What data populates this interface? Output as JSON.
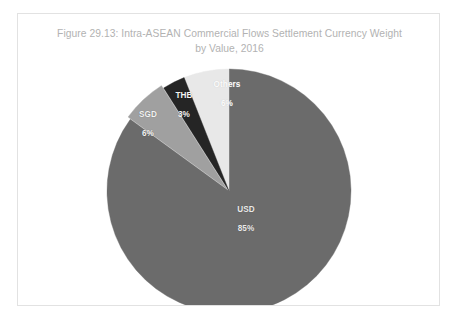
{
  "figure": {
    "title": "Figure 29.13: Intra-ASEAN Commercial Flows Settlement Currency Weight\nby Value, 2016",
    "title_color": "#b2b2b2",
    "border_color": "#e2e2e2",
    "background": "#ffffff"
  },
  "chart_data": {
    "type": "pie",
    "title": "Figure 29.13: Intra-ASEAN Commercial Flows Settlement Currency Weight by Value, 2016",
    "xlabel": "",
    "ylabel": "",
    "unit": "%",
    "start_angle_deg": 0,
    "direction": "clockwise",
    "legend": "none",
    "grid": false,
    "data_labels": "inside",
    "categories": [
      "USD",
      "Others",
      "THB",
      "SGD"
    ],
    "values": [
      85,
      6,
      3,
      6
    ],
    "colors": [
      "#6b6b6b",
      "#e8e8e8",
      "#252525",
      "#a0a0a0"
    ],
    "slices": [
      {
        "name": "USD",
        "value": 85,
        "label": "USD",
        "percent_label": "85%",
        "color": "#6b6b6b",
        "exploded": false
      },
      {
        "name": "Others",
        "value": 6,
        "label": "Others",
        "percent_label": "6%",
        "color": "#e8e8e8",
        "exploded": false
      },
      {
        "name": "THB",
        "value": 3,
        "label": "THB",
        "percent_label": "3%",
        "color": "#252525",
        "exploded": false
      },
      {
        "name": "SGD",
        "value": 6,
        "label": "SGD",
        "percent_label": "6%",
        "color": "#a0a0a0",
        "exploded": true
      }
    ]
  }
}
